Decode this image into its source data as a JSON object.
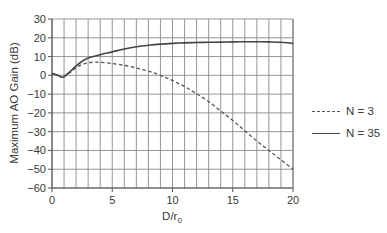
{
  "chart_data": {
    "type": "line",
    "title": "",
    "xlabel": "D/r0",
    "xlabel_main": "D/r",
    "xlabel_sub": "0",
    "ylabel": "Maximum AO Gain (dB)",
    "xlim": [
      0,
      20
    ],
    "ylim": [
      -60,
      30
    ],
    "xticks": [
      0,
      5,
      10,
      15,
      20
    ],
    "yticks": [
      30,
      20,
      10,
      0,
      -10,
      -20,
      -30,
      -40,
      -50,
      -60
    ],
    "grid": true,
    "grid_x_step": 1,
    "grid_y_step": 10,
    "legend_position": "right",
    "series": [
      {
        "name": "N = 3",
        "style": "dashed",
        "color": "#555555",
        "x": [
          0,
          0.5,
          0.9,
          1.5,
          2,
          2.5,
          3,
          3.5,
          4,
          5,
          6,
          7,
          8,
          9,
          10,
          11,
          12,
          13,
          14,
          15,
          16,
          17,
          18,
          19,
          20
        ],
        "y": [
          1,
          0,
          -1,
          1.5,
          4,
          5.8,
          6.7,
          7,
          6.9,
          6.3,
          5.3,
          3.9,
          2.2,
          0,
          -2.8,
          -6,
          -9.8,
          -14,
          -19,
          -24,
          -29.5,
          -35,
          -40,
          -45,
          -50
        ]
      },
      {
        "name": "N = 35",
        "style": "solid",
        "color": "#444444",
        "x": [
          0,
          0.5,
          0.9,
          1.5,
          2,
          2.5,
          3,
          4,
          5,
          6,
          7,
          8,
          9,
          10,
          11,
          12,
          13,
          14,
          15,
          16,
          17,
          18,
          19,
          20
        ],
        "y": [
          1,
          0,
          -1,
          2,
          5,
          7.5,
          9.2,
          11,
          12.5,
          14,
          15.2,
          16,
          16.6,
          17,
          17.3,
          17.5,
          17.6,
          17.7,
          17.8,
          17.9,
          17.9,
          17.8,
          17.6,
          17
        ]
      }
    ]
  },
  "legend": {
    "items": [
      {
        "label": "N = 3",
        "style": "dashed"
      },
      {
        "label": "N = 35",
        "style": "solid"
      }
    ]
  }
}
